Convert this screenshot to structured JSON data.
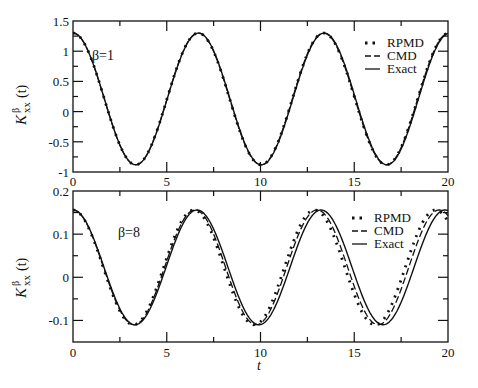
{
  "figure": {
    "xlabel": "t",
    "ylabel_main": "K",
    "ylabel_sup": "β",
    "ylabel_sub": "xx",
    "ylabel_arg": "(t)"
  },
  "chart_data": [
    {
      "type": "line",
      "panel": "top",
      "annotation": "β=1",
      "xlim": [
        0,
        20
      ],
      "ylim": [
        -1,
        1.5
      ],
      "xticks": [
        "0",
        "5",
        "10",
        "15",
        "20"
      ],
      "yticks": [
        "-1",
        "-0.5",
        "0",
        "0.5",
        "1",
        "1.5"
      ],
      "legend": [
        "RPMD",
        "CMD",
        "Exact"
      ],
      "legend_position": "upper right",
      "grid": false,
      "model": {
        "mean": 0.21,
        "amp": 1.09,
        "omega": 0.94
      },
      "series": [
        {
          "name": "RPMD",
          "style": "dotted",
          "omega": 0.94,
          "phase": 0.0
        },
        {
          "name": "CMD",
          "style": "dashed",
          "omega": 0.94,
          "phase": 0.0
        },
        {
          "name": "Exact",
          "style": "solid",
          "omega": 0.938,
          "phase": 0.0
        }
      ],
      "x": [
        0,
        3.3,
        6.7,
        10.0,
        13.4,
        16.8,
        20
      ],
      "values_exact": [
        1.3,
        -0.88,
        1.3,
        -0.88,
        1.3,
        -0.88,
        1.05
      ]
    },
    {
      "type": "line",
      "panel": "bottom",
      "annotation": "β=8",
      "xlim": [
        0,
        20
      ],
      "ylim": [
        -0.15,
        0.2
      ],
      "xticks": [
        "0",
        "5",
        "10",
        "15",
        "20"
      ],
      "yticks": [
        "-0.1",
        "0",
        "0.1",
        "0.2"
      ],
      "legend": [
        "RPMD",
        "CMD",
        "Exact"
      ],
      "legend_position": "upper right",
      "grid": false,
      "model": {
        "mean": 0.023,
        "amp": 0.133,
        "omega": 0.955
      },
      "series": [
        {
          "name": "RPMD",
          "style": "dotted",
          "omega": 0.975,
          "phase": 0.0
        },
        {
          "name": "CMD",
          "style": "dashed",
          "omega": 0.965,
          "phase": 0.0
        },
        {
          "name": "Exact",
          "style": "solid",
          "omega": 0.95,
          "phase": 0.0
        }
      ],
      "x": [
        0,
        3.3,
        6.6,
        9.9,
        13.2,
        16.5,
        19.8
      ],
      "values_exact": [
        0.155,
        -0.11,
        0.155,
        -0.11,
        0.155,
        -0.11,
        0.155
      ]
    }
  ]
}
